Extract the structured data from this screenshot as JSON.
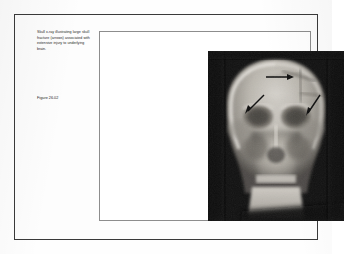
{
  "document": {
    "type": "textbook-figure-plate",
    "background_color": "#fefefe",
    "frame_color": "#3a3a3a",
    "inner_frame_color": "#8d8d8d"
  },
  "caption": {
    "text": "Skull x-ray illustrating large skull fracture (arrows) associated with extensive injury to underlying brain.",
    "figure_label": "Figure 26.02"
  },
  "figure": {
    "name": "skull-xray-radiograph",
    "modality": "X-ray",
    "view": "anteroposterior",
    "background_color": "#0b0b0b",
    "finding": "large skull fracture with extensive underlying brain injury",
    "annotations": [
      {
        "name": "fracture-arrow-top",
        "direction": "right",
        "region": "right frontal / parietal vault"
      },
      {
        "name": "fracture-arrow-left",
        "direction": "down-left",
        "region": "left orbital roof"
      },
      {
        "name": "fracture-arrow-right",
        "direction": "down-right",
        "region": "right temporal region"
      }
    ],
    "annotation_color": "#111111"
  }
}
